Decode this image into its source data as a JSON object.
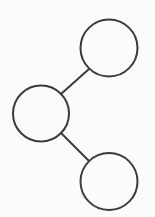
{
  "diagram": {
    "type": "node-link-diagram",
    "canvas": {
      "width": 155,
      "height": 217,
      "background_color": "#fcfcfb"
    },
    "style": {
      "stroke_color": "#3b3b3b",
      "stroke_width": 2,
      "node_fill": "none"
    },
    "nodes": [
      {
        "id": "node-top",
        "label": "",
        "cx": 109,
        "cy": 48,
        "r": 28.5
      },
      {
        "id": "node-middle",
        "label": "",
        "cx": 41,
        "cy": 113.5,
        "r": 28
      },
      {
        "id": "node-bottom",
        "label": "",
        "cx": 109,
        "cy": 181.5,
        "r": 28.5
      }
    ],
    "edges": [
      {
        "id": "edge-middle-top",
        "from": "node-middle",
        "to": "node-top",
        "x1": 61,
        "y1": 94,
        "x2": 89,
        "y2": 69
      },
      {
        "id": "edge-middle-bottom",
        "from": "node-middle",
        "to": "node-bottom",
        "x1": 61,
        "y1": 133,
        "x2": 89,
        "y2": 161
      }
    ]
  }
}
